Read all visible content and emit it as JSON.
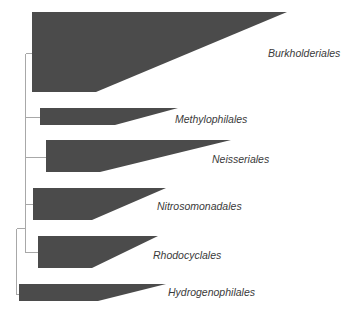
{
  "diagram": {
    "type": "phylogenetic-tree",
    "style": {
      "clade_fill": "#4b4b4b",
      "branch_color": "#a8a8a8",
      "label_color": "#3a3a3a"
    },
    "clades": [
      {
        "name": "Burkholderiales",
        "shape": {
          "x": 32,
          "top": 12,
          "bottom": 92,
          "bottom_end": 96,
          "tip": 287
        },
        "branch_y": 53,
        "label_pos": {
          "x": 268,
          "y": 47
        }
      },
      {
        "name": "Methylophilales",
        "shape": {
          "x": 40,
          "top": 108,
          "bottom": 125,
          "bottom_end": 115,
          "tip": 178
        },
        "branch_y": 117,
        "label_pos": {
          "x": 175,
          "y": 113
        }
      },
      {
        "name": "Neisseriales",
        "shape": {
          "x": 46,
          "top": 140,
          "bottom": 172,
          "bottom_end": 100,
          "tip": 231
        },
        "branch_y": 157,
        "label_pos": {
          "x": 212,
          "y": 153
        }
      },
      {
        "name": "Nitrosomonadales",
        "shape": {
          "x": 33,
          "top": 188,
          "bottom": 220,
          "bottom_end": 92,
          "tip": 166
        },
        "branch_y": 204,
        "label_pos": {
          "x": 157,
          "y": 200
        }
      },
      {
        "name": "Rhodocyclales",
        "shape": {
          "x": 38,
          "top": 236,
          "bottom": 268,
          "bottom_end": 92,
          "tip": 158
        },
        "branch_y": 252,
        "label_pos": {
          "x": 153,
          "y": 249
        }
      },
      {
        "name": "Hydrogenophilales",
        "shape": {
          "x": 19,
          "top": 284,
          "bottom": 301,
          "bottom_end": 98,
          "tip": 166
        },
        "branch_y": 294,
        "label_pos": {
          "x": 168,
          "y": 286
        }
      }
    ],
    "internal_nodes": [
      {
        "x": 25,
        "y_top": 53,
        "y_bottom": 252,
        "parent_y": 228
      },
      {
        "x": 16,
        "y_top": 228,
        "y_bottom": 294
      }
    ]
  }
}
